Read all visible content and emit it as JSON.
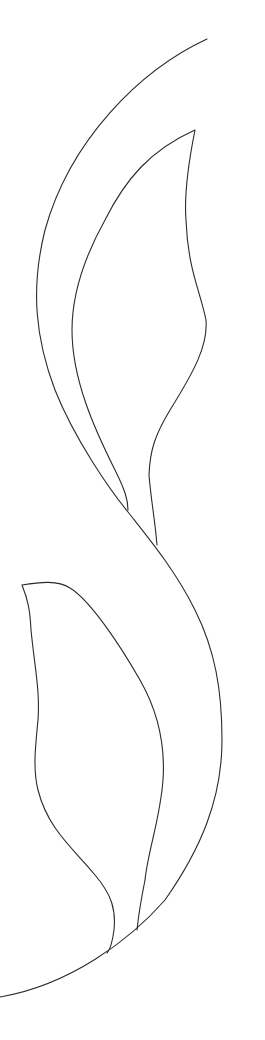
{
  "artwork": {
    "description": "Line drawing of an S-shaped stem with two leaves",
    "background_color": "#ffffff",
    "stroke_color": "#2a2a2a",
    "elements": [
      {
        "name": "main-stem-curve"
      },
      {
        "name": "upper-leaf"
      },
      {
        "name": "lower-leaf"
      }
    ]
  }
}
